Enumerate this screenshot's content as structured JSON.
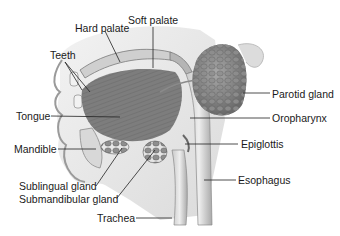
{
  "diagram": {
    "labels": {
      "soft_palate": "Soft palate",
      "hard_palate": "Hard palate",
      "teeth": "Teeth",
      "tongue": "Tongue",
      "mandible": "Mandible",
      "sublingual_gland": "Sublingual gland",
      "submandibular_gland": "Submandibular gland",
      "trachea": "Trachea",
      "parotid_gland": "Parotid gland",
      "oropharynx": "Oropharynx",
      "epiglottis": "Epiglottis",
      "esophagus": "Esophagus"
    },
    "colors": {
      "background": "#ffffff",
      "tissue_dark": "#6e6e6e",
      "tissue_mid": "#9a9a9a",
      "tissue_light": "#d4d4d4",
      "leader_line": "#222222",
      "text": "#1a1a1a"
    }
  }
}
